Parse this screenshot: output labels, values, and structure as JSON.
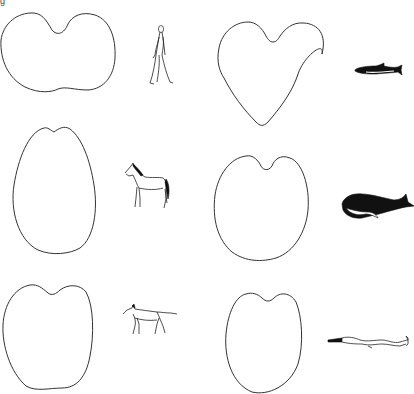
{
  "figure": {
    "panel_label": "g",
    "background": "#ffffff",
    "stroke_color": "#333333",
    "rows": [
      {
        "pairs": [
          {
            "shape": "kidney-shaped outline (wide, shallow notch top and bottom)",
            "animal": "human",
            "icon": "human-walking-icon"
          },
          {
            "shape": "heart-shaped outline (pointed bottom)",
            "animal": "dolphin",
            "icon": "dolphin-icon"
          }
        ]
      },
      {
        "pairs": [
          {
            "shape": "egg/oval outline (narrow, small notch on top)",
            "animal": "horse",
            "icon": "horse-icon"
          },
          {
            "shape": "rounded heart outline (broad)",
            "animal": "whale",
            "icon": "whale-icon"
          }
        ]
      },
      {
        "pairs": [
          {
            "shape": "apple-shaped outline (notch on top)",
            "animal": "dog",
            "icon": "dog-icon"
          },
          {
            "shape": "oval outline with notch on top",
            "animal": "eel/lamprey",
            "icon": "eel-icon"
          }
        ]
      }
    ]
  }
}
